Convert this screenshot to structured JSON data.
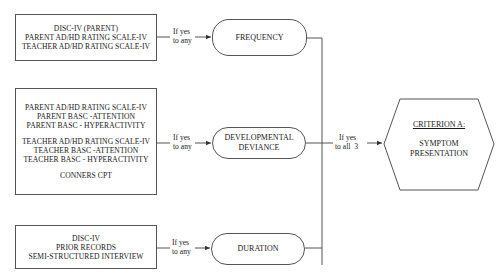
{
  "diagram": {
    "sources": [
      {
        "id": "frequency-sources",
        "lines": [
          "DISC-IV (PARENT)",
          "PARENT AD/HD RATING SCALE-IV",
          "TEACHER AD/HD RATING SCALE-IV"
        ]
      },
      {
        "id": "deviance-sources",
        "groups": [
          [
            "PARENT AD/HD RATING SCALE-IV",
            "PARENT BASC -ATTENTION",
            "PARENT BASC - HYPERACTIVITY"
          ],
          [
            "TEACHER AD/HD RATING SCALE-IV",
            "TEACHER BASC -ATTENTION",
            "TEACHER BASC - HYPERACTIVITY"
          ],
          [
            "CONNERS CPT"
          ]
        ]
      },
      {
        "id": "duration-sources",
        "lines": [
          "DISC-IV",
          "PRIOR RECORDS",
          "SEMI-STRUCTURED INTERVIEW"
        ]
      }
    ],
    "conditions": {
      "any": [
        "If yes",
        "to any"
      ],
      "all": [
        "If yes",
        "to all  3"
      ]
    },
    "criteria_nodes": [
      {
        "id": "frequency",
        "lines": [
          "FREQUENCY"
        ]
      },
      {
        "id": "developmental-deviance",
        "lines": [
          "DEVELOPMENTAL",
          "DEVIANCE"
        ]
      },
      {
        "id": "duration",
        "lines": [
          "DURATION"
        ]
      }
    ],
    "outcome": {
      "title": "CRITERION A:",
      "lines": [
        "SYMPTOM",
        "PRESENTATION"
      ]
    },
    "colors": {
      "line": "#555555",
      "text": "#1a1a1a",
      "background": "#ffffff"
    }
  }
}
